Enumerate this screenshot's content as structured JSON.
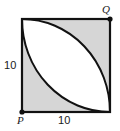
{
  "figure": {
    "background_color": "#ffffff",
    "stroke_color": "#111111",
    "shaded_color": "#d6d6d6",
    "unshaded_color": "#ffffff",
    "square": {
      "side_length_label": "10",
      "left": 22,
      "top": 19,
      "size": 88
    },
    "vertices": [
      {
        "name": "P",
        "label": "P",
        "position": "bottom-left",
        "marker": "dot"
      },
      {
        "name": "Q",
        "label": "Q",
        "position": "top-right",
        "marker": "dot"
      }
    ],
    "dimension_labels": [
      {
        "name": "left-side",
        "text": "10",
        "orientation": "vertical-side"
      },
      {
        "name": "bottom-side",
        "text": "10",
        "orientation": "horizontal-side"
      }
    ],
    "arcs": [
      {
        "name": "arc-centered-at-P",
        "description": "quarter circle radius 10 centered at bottom-left vertex P, from top-left corner to bottom-right corner",
        "radius_label": "10"
      },
      {
        "name": "arc-centered-at-Q",
        "description": "quarter circle radius 10 centered at top-right vertex Q, from top-left corner to bottom-right corner",
        "radius_label": "10"
      }
    ],
    "regions": [
      {
        "name": "lens-region",
        "fill": "white",
        "description": "vesica/lens shape between the two arcs"
      },
      {
        "name": "upper-right-lune",
        "fill": "shaded"
      },
      {
        "name": "lower-left-lune",
        "fill": "shaded"
      }
    ]
  }
}
